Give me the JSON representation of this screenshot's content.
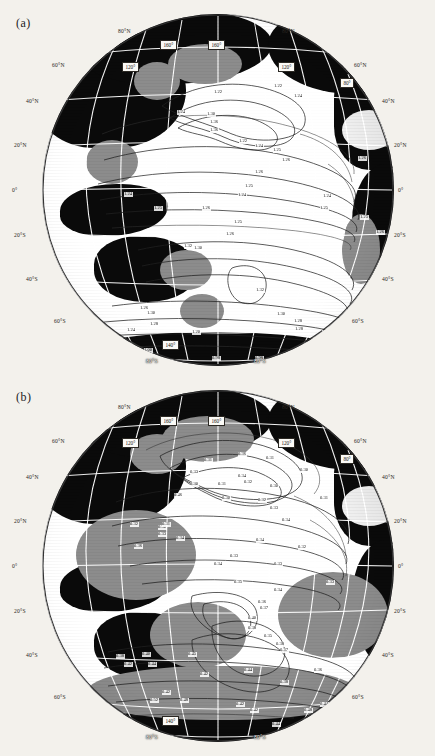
{
  "figure": {
    "panels": [
      {
        "key": "a",
        "label": "(a)",
        "latitude_labels_left": [
          "80°N",
          "60°N",
          "40°N",
          "20°N",
          "0°",
          "20°S",
          "40°S",
          "60°S",
          "80°S"
        ],
        "latitude_labels_right": [
          "80°N",
          "60°N",
          "40°N",
          "20°N",
          "0°",
          "20°S",
          "40°S",
          "60°S",
          "80°S"
        ],
        "longitude_boxes": [
          "160°",
          "160°",
          "120°",
          "120°",
          "80°",
          "140°"
        ],
        "contour_labels": [
          "1.22",
          "1.24",
          "1.25",
          "1.26",
          "1.28",
          "1.30",
          "1.36",
          "1.34",
          "1.32",
          "1.31",
          "1.10",
          "1.00",
          "0.98"
        ]
      },
      {
        "key": "b",
        "label": "(b)",
        "latitude_labels_left": [
          "80°N",
          "60°N",
          "40°N",
          "20°N",
          "0°",
          "20°S",
          "40°S",
          "60°S",
          "80°S"
        ],
        "latitude_labels_right": [
          "80°N",
          "60°N",
          "40°N",
          "20°N",
          "0°",
          "20°S",
          "40°S",
          "60°S",
          "80°S"
        ],
        "longitude_boxes": [
          "160°",
          "160°",
          "120°",
          "120°",
          "80°",
          "140°"
        ],
        "contour_labels": [
          "0.30",
          "0.31",
          "0.32",
          "0.33",
          "0.34",
          "0.36",
          "0.38",
          "0.40",
          "0.42",
          "0.44",
          "0.45",
          "0.46",
          "0.48",
          "0.50",
          "0.52",
          "0.54",
          "0.56",
          "0.57",
          "0.58"
        ]
      }
    ]
  },
  "panel_a": {
    "label": "(a)",
    "lat": {
      "l80n": "80°N",
      "l60n": "60°N",
      "l40n": "40°N",
      "l20n": "20°N",
      "l0": "0°",
      "l20s": "20°S",
      "l40s": "40°S",
      "l60s": "60°S",
      "l80s": "80°S",
      "r80n": "80°N",
      "r60n": "60°N",
      "r40n": "40°N",
      "r20n": "20°N",
      "r0": "0°",
      "r20s": "20°S",
      "r40s": "40°S",
      "r60s": "60°S",
      "r80s": "80°S"
    },
    "lon": {
      "b160w": "160°",
      "b160e": "160°",
      "b120w": "120°",
      "b120e": "120°",
      "b80": "80°",
      "b140": "140°"
    },
    "contours": [
      {
        "t": "1.22",
        "x": 172,
        "y": 76
      },
      {
        "t": "1.22",
        "x": 232,
        "y": 70
      },
      {
        "t": "1.24",
        "x": 252,
        "y": 80
      },
      {
        "t": "1.24",
        "x": 135,
        "y": 96
      },
      {
        "t": "1.30",
        "x": 165,
        "y": 98
      },
      {
        "t": "1.36",
        "x": 168,
        "y": 106
      },
      {
        "t": "1.36",
        "x": 168,
        "y": 114
      },
      {
        "t": "1.22",
        "x": 197,
        "y": 125
      },
      {
        "t": "1.24",
        "x": 213,
        "y": 130
      },
      {
        "t": "1.25",
        "x": 231,
        "y": 134
      },
      {
        "t": "1.26",
        "x": 240,
        "y": 144
      },
      {
        "t": "1.26",
        "x": 316,
        "y": 142
      },
      {
        "t": "1.26",
        "x": 213,
        "y": 156
      },
      {
        "t": "1.25",
        "x": 203,
        "y": 170
      },
      {
        "t": "1.24",
        "x": 196,
        "y": 179
      },
      {
        "t": "1.24",
        "x": 281,
        "y": 180
      },
      {
        "t": "1.25",
        "x": 112,
        "y": 192
      },
      {
        "t": "1.26",
        "x": 160,
        "y": 192
      },
      {
        "t": "1.25",
        "x": 278,
        "y": 192
      },
      {
        "t": "1.25",
        "x": 318,
        "y": 201
      },
      {
        "t": "1.25",
        "x": 192,
        "y": 206
      },
      {
        "t": "1.26",
        "x": 184,
        "y": 218
      },
      {
        "t": "1.26",
        "x": 334,
        "y": 216
      },
      {
        "t": "1.24",
        "x": 352,
        "y": 220
      },
      {
        "t": "1.32",
        "x": 142,
        "y": 230
      },
      {
        "t": "1.30",
        "x": 152,
        "y": 232
      },
      {
        "t": "1.24",
        "x": 82,
        "y": 178
      },
      {
        "t": "1.32",
        "x": 214,
        "y": 274
      },
      {
        "t": "1.30",
        "x": 235,
        "y": 298
      },
      {
        "t": "1.28",
        "x": 252,
        "y": 305
      },
      {
        "t": "1.28",
        "x": 253,
        "y": 313
      },
      {
        "t": "1.24",
        "x": 280,
        "y": 316
      },
      {
        "t": "1.28",
        "x": 306,
        "y": 306
      },
      {
        "t": "1.28",
        "x": 330,
        "y": 270
      },
      {
        "t": "1.30",
        "x": 352,
        "y": 263
      },
      {
        "t": "1.31",
        "x": 378,
        "y": 266
      },
      {
        "t": "1.26",
        "x": 98,
        "y": 292
      },
      {
        "t": "1.30",
        "x": 105,
        "y": 297
      },
      {
        "t": "1.28",
        "x": 108,
        "y": 308
      },
      {
        "t": "1.24",
        "x": 85,
        "y": 314
      },
      {
        "t": "1.20",
        "x": 150,
        "y": 316
      },
      {
        "t": "1.10",
        "x": 122,
        "y": 326
      },
      {
        "t": "1.00",
        "x": 102,
        "y": 334
      },
      {
        "t": "0.98",
        "x": 170,
        "y": 342
      },
      {
        "t": "0.98",
        "x": 213,
        "y": 342
      },
      {
        "t": "1.00",
        "x": 262,
        "y": 338
      },
      {
        "t": "1.02",
        "x": 288,
        "y": 342
      },
      {
        "t": "1.00",
        "x": 310,
        "y": 344
      },
      {
        "t": "1.10",
        "x": 300,
        "y": 330
      },
      {
        "t": "1.10",
        "x": 180,
        "y": 356
      }
    ]
  },
  "panel_b": {
    "label": "(b)",
    "lat": {
      "l80n": "80°N",
      "l60n": "60°N",
      "l40n": "40°N",
      "l20n": "20°N",
      "l0": "0°",
      "l20s": "20°S",
      "l40s": "40°S",
      "l60s": "60°S",
      "l80s": "80°S",
      "r80n": "80°N",
      "r60n": "60°N",
      "r40n": "40°N",
      "r20n": "20°N",
      "r0": "0°",
      "r20s": "20°S",
      "r40s": "40°S",
      "r60s": "60°S",
      "r80s": "80°S"
    },
    "lon": {
      "b160w": "160°",
      "b160e": "160°",
      "b120w": "120°",
      "b120e": "120°",
      "b80": "80°",
      "b140": "140°"
    },
    "contours": [
      {
        "t": "0.36",
        "x": 196,
        "y": 62
      },
      {
        "t": "0.31",
        "x": 162,
        "y": 68
      },
      {
        "t": "0.31",
        "x": 224,
        "y": 66
      },
      {
        "t": "0.34",
        "x": 196,
        "y": 84
      },
      {
        "t": "0.30",
        "x": 258,
        "y": 78
      },
      {
        "t": "0.33",
        "x": 148,
        "y": 80
      },
      {
        "t": "0.30",
        "x": 148,
        "y": 92
      },
      {
        "t": "0.31",
        "x": 176,
        "y": 92
      },
      {
        "t": "0.32",
        "x": 202,
        "y": 90
      },
      {
        "t": "0.30",
        "x": 228,
        "y": 94
      },
      {
        "t": "0.46",
        "x": 132,
        "y": 103
      },
      {
        "t": "0.30",
        "x": 180,
        "y": 106
      },
      {
        "t": "0.32",
        "x": 216,
        "y": 108
      },
      {
        "t": "0.31",
        "x": 278,
        "y": 106
      },
      {
        "t": "0.33",
        "x": 228,
        "y": 116
      },
      {
        "t": "0.34",
        "x": 240,
        "y": 128
      },
      {
        "t": "0.32",
        "x": 88,
        "y": 132
      },
      {
        "t": "0.30",
        "x": 116,
        "y": 135
      },
      {
        "t": "0.31",
        "x": 120,
        "y": 132
      },
      {
        "t": "0.33",
        "x": 116,
        "y": 142
      },
      {
        "t": "0.34",
        "x": 134,
        "y": 146
      },
      {
        "t": "0.36",
        "x": 92,
        "y": 154
      },
      {
        "t": "0.34",
        "x": 214,
        "y": 148
      },
      {
        "t": "0.32",
        "x": 256,
        "y": 155
      },
      {
        "t": "0.33",
        "x": 188,
        "y": 164
      },
      {
        "t": "0.34",
        "x": 172,
        "y": 172
      },
      {
        "t": "0.33",
        "x": 232,
        "y": 172
      },
      {
        "t": "0.33",
        "x": 284,
        "y": 190
      },
      {
        "t": "0.35",
        "x": 192,
        "y": 190
      },
      {
        "t": "0.34",
        "x": 232,
        "y": 198
      },
      {
        "t": "0.36",
        "x": 216,
        "y": 210
      },
      {
        "t": "0.37",
        "x": 218,
        "y": 216
      },
      {
        "t": "0.40",
        "x": 206,
        "y": 226
      },
      {
        "t": "0.38",
        "x": 206,
        "y": 236
      },
      {
        "t": "0.35",
        "x": 222,
        "y": 244
      },
      {
        "t": "0.38",
        "x": 234,
        "y": 252
      },
      {
        "t": "0.37",
        "x": 238,
        "y": 258
      },
      {
        "t": "0.38",
        "x": 74,
        "y": 264
      },
      {
        "t": "0.40",
        "x": 100,
        "y": 262
      },
      {
        "t": "0.45",
        "x": 146,
        "y": 262
      },
      {
        "t": "0.42",
        "x": 82,
        "y": 272
      },
      {
        "t": "0.44",
        "x": 106,
        "y": 272
      },
      {
        "t": "0.36",
        "x": 272,
        "y": 278
      },
      {
        "t": "0.36",
        "x": 330,
        "y": 282
      },
      {
        "t": "0.42",
        "x": 158,
        "y": 282
      },
      {
        "t": "0.44",
        "x": 202,
        "y": 278
      },
      {
        "t": "0.38",
        "x": 238,
        "y": 290
      },
      {
        "t": "0.42",
        "x": 120,
        "y": 300
      },
      {
        "t": "0.52",
        "x": 108,
        "y": 308
      },
      {
        "t": "0.48",
        "x": 138,
        "y": 308
      },
      {
        "t": "0.42",
        "x": 194,
        "y": 312
      },
      {
        "t": "0.42",
        "x": 208,
        "y": 318
      },
      {
        "t": "0.48",
        "x": 262,
        "y": 318
      },
      {
        "t": "0.44",
        "x": 278,
        "y": 312
      },
      {
        "t": "0.45",
        "x": 286,
        "y": 318
      },
      {
        "t": "0.44",
        "x": 302,
        "y": 320
      },
      {
        "t": "0.44",
        "x": 230,
        "y": 332
      }
    ]
  }
}
